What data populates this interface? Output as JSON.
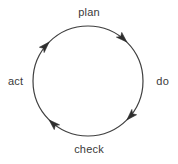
{
  "diagram": {
    "type": "circular-cycle-diagram",
    "stroke_color": "#3f3f3f",
    "text_color": "#3a3a3a",
    "background_color": "#ffffff",
    "circle": {
      "center_x": 88,
      "center_y": 81,
      "radius": 55,
      "stroke_width": 1.2
    },
    "direction": "clockwise",
    "labels": {
      "plan": "plan",
      "do": "do",
      "check": "check",
      "act": "act"
    },
    "arrows": [
      {
        "name": "arrow-toward-plan",
        "angle_deg": 225,
        "points_to": "plan"
      },
      {
        "name": "arrow-toward-do",
        "angle_deg": 315,
        "points_to": "do"
      },
      {
        "name": "arrow-toward-check",
        "angle_deg": 45,
        "points_to": "check"
      },
      {
        "name": "arrow-toward-act",
        "angle_deg": 135,
        "points_to": "act"
      }
    ]
  }
}
